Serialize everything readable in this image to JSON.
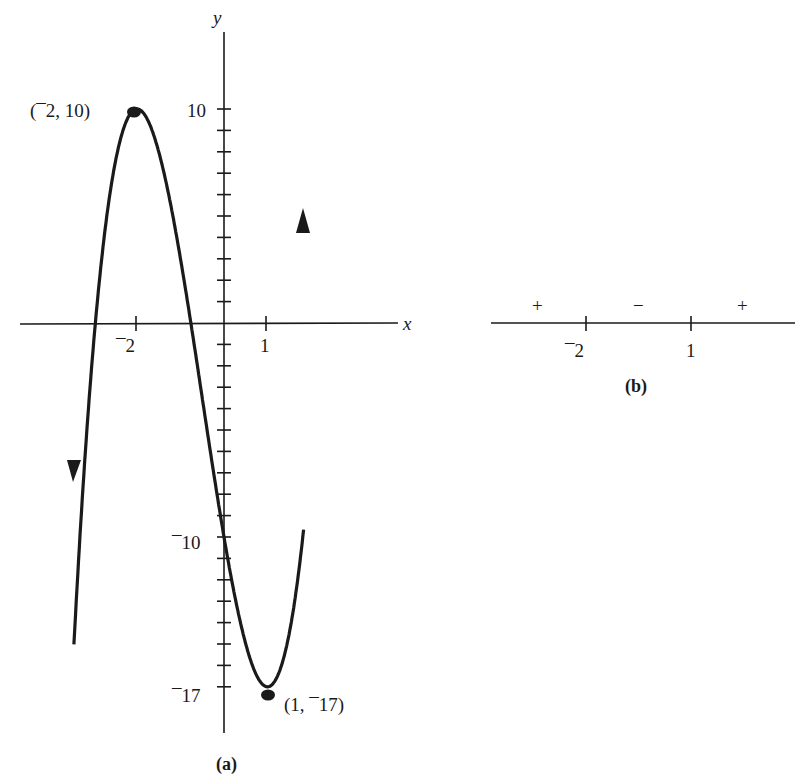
{
  "chart_data": [
    {
      "id": "a",
      "type": "line",
      "title": "",
      "caption": "(a)",
      "function_hint": "cubic with local max at (-2, 10) and local min at (1, -17)",
      "xlabel": "x",
      "ylabel": "y",
      "x_ticks": [
        {
          "value": -2,
          "label": "⁻2"
        },
        {
          "value": 1,
          "label": "1"
        }
      ],
      "y_ticks_labeled": [
        {
          "value": 10,
          "label": "10"
        },
        {
          "value": -10,
          "label": "⁻10"
        },
        {
          "value": -17,
          "label": "⁻17"
        }
      ],
      "y_tick_step": 1,
      "xlim": [
        -3.1,
        4.2
      ],
      "ylim": [
        -19,
        14
      ],
      "grid": false,
      "legend": null,
      "points": [
        {
          "x": -3.2,
          "y": -15.1
        },
        {
          "x": -3,
          "y": -1
        },
        {
          "x": -2.5,
          "y": 7.5
        },
        {
          "x": -2,
          "y": 10
        },
        {
          "x": -1.5,
          "y": 6.5
        },
        {
          "x": -1,
          "y": 3
        },
        {
          "x": -0.5,
          "y": -3.5
        },
        {
          "x": 0,
          "y": -10
        },
        {
          "x": 0.5,
          "y": -15
        },
        {
          "x": 1,
          "y": -17
        },
        {
          "x": 1.5,
          "y": -11.5
        },
        {
          "x": 1.85,
          "y": 6
        }
      ],
      "annotations": [
        {
          "text": "(⁻2, 10)",
          "x": -2,
          "y": 10
        },
        {
          "text": "(1, ⁻17)",
          "x": 1,
          "y": -17
        }
      ]
    },
    {
      "id": "b",
      "type": "sign-chart",
      "caption": "(b)",
      "ticks": [
        {
          "value": -2,
          "label": "⁻2"
        },
        {
          "value": 1,
          "label": "1"
        }
      ],
      "signs": [
        "+",
        "−",
        "+"
      ]
    }
  ],
  "labels": {
    "x_axis": "x",
    "y_axis": "y",
    "a_caption": "(a)",
    "b_caption": "(b)",
    "max_point": "(¯2, 10)",
    "min_point": "(1, ¯17)",
    "tick_x_neg2": "¯2",
    "tick_x_1": "1",
    "tick_y_10": "10",
    "tick_y_neg10": "¯10",
    "tick_y_neg17": "¯17",
    "sign_left": "+",
    "sign_mid": "−",
    "sign_right": "+",
    "b_tick_neg2": "¯2",
    "b_tick_1": "1"
  },
  "colors": {
    "ink": "#1a1a1a",
    "background": "#ffffff"
  }
}
